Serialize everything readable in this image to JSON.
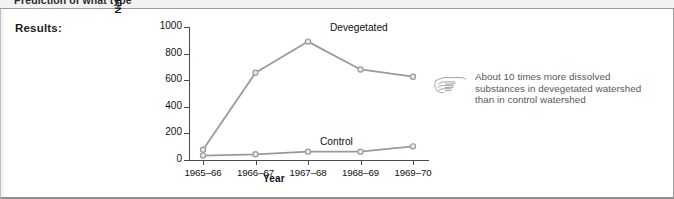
{
  "previous_row": {
    "text": "Prediction of what type"
  },
  "panel": {
    "results_label": "Results:"
  },
  "annotation": {
    "icon": "pointing-hand-icon",
    "lines": [
      "About 10 times more dissolved",
      "substances in devegetated watershed",
      "than in control watershed"
    ]
  },
  "chart_data": {
    "type": "line",
    "title": "",
    "xlabel": "Year",
    "ylabel": "Net dissolved substances (kg/ha)",
    "categories": [
      "1965–66",
      "1966–67",
      "1967–68",
      "1968–69",
      "1969–70"
    ],
    "yticks": [
      0,
      200,
      400,
      600,
      800,
      1000
    ],
    "ylim": [
      0,
      1000
    ],
    "grid": false,
    "legend": "inline-labels",
    "series": [
      {
        "name": "Devegetated",
        "values": [
          75,
          655,
          890,
          680,
          625
        ],
        "color": "#9a9a9a",
        "marker": "circle-open"
      },
      {
        "name": "Control",
        "values": [
          30,
          40,
          60,
          60,
          100
        ],
        "color": "#9a9a9a",
        "marker": "circle-open"
      }
    ]
  },
  "colors": {
    "line": "#9a9a9a",
    "marker_fill": "#e8e8e8",
    "axis": "#4a4a4a",
    "text": "#111111",
    "annotation_text": "#585858"
  }
}
